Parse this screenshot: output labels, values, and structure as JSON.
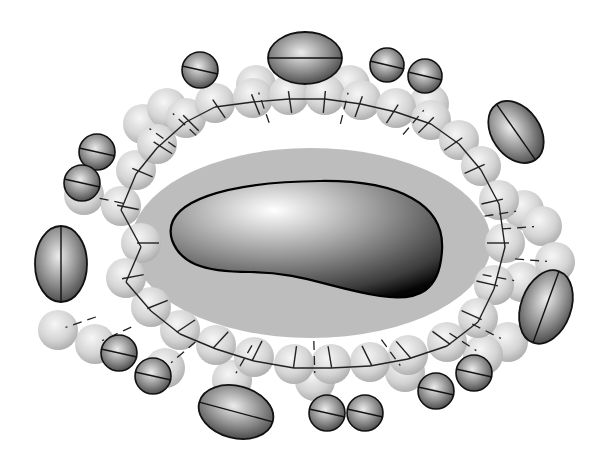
{
  "figure": {
    "colors": {
      "background": "#ffffff",
      "halo": "#bdbdbd",
      "light_sphere_highlight": "#f4f4f4",
      "light_sphere_shade": "#b0b0b0",
      "dark_sphere_highlight": "#e6e6e6",
      "dark_sphere_shade": "#3a3a3a",
      "core_highlight": "#ffffff",
      "core_shade": "#000000",
      "outline": "#111111"
    },
    "core": {
      "path": "M172,240 C160,200 230,182 320,181 C400,180 445,205 442,250 C440,290 420,302 380,296 C330,288 300,272 250,272 C200,272 180,262 172,240 Z"
    },
    "halo": {
      "cx": 311,
      "cy": 243,
      "rx": 180,
      "ry": 95
    },
    "inner_ring": [
      [
        141,
        243
      ],
      [
        121,
        206
      ],
      [
        136,
        170
      ],
      [
        157,
        144
      ],
      [
        186,
        118
      ],
      [
        215,
        103
      ],
      [
        253,
        98
      ],
      [
        289,
        95
      ],
      [
        325,
        95
      ],
      [
        361,
        100
      ],
      [
        396,
        108
      ],
      [
        431,
        120
      ],
      [
        459,
        140
      ],
      [
        481,
        166
      ],
      [
        499,
        200
      ],
      [
        505,
        243
      ],
      [
        494,
        285
      ],
      [
        478,
        318
      ],
      [
        447,
        342
      ],
      [
        408,
        355
      ],
      [
        370,
        362
      ],
      [
        331,
        364
      ],
      [
        294,
        364
      ],
      [
        254,
        357
      ],
      [
        216,
        345
      ],
      [
        180,
        330
      ],
      [
        151,
        307
      ],
      [
        126,
        278
      ]
    ],
    "outer_ring": [
      [
        84,
        195
      ],
      [
        143,
        124
      ],
      [
        167,
        108
      ],
      [
        256,
        85
      ],
      [
        350,
        85
      ],
      [
        429,
        104
      ],
      [
        524,
        210
      ],
      [
        542,
        226
      ],
      [
        555,
        262
      ],
      [
        522,
        282
      ],
      [
        508,
        342
      ],
      [
        483,
        355
      ],
      [
        405,
        372
      ],
      [
        315,
        381
      ],
      [
        232,
        380
      ],
      [
        165,
        368
      ],
      [
        95,
        344
      ],
      [
        58,
        330
      ]
    ],
    "dark_spheres": [
      {
        "cx": 97,
        "cy": 152,
        "r": 18
      },
      {
        "cx": 82,
        "cy": 183,
        "r": 18
      },
      {
        "cx": 200,
        "cy": 70,
        "r": 18
      },
      {
        "cx": 387,
        "cy": 65,
        "r": 17
      },
      {
        "cx": 425,
        "cy": 76,
        "r": 17
      },
      {
        "cx": 119,
        "cy": 353,
        "r": 18
      },
      {
        "cx": 153,
        "cy": 376,
        "r": 18
      },
      {
        "cx": 327,
        "cy": 413,
        "r": 18
      },
      {
        "cx": 365,
        "cy": 413,
        "r": 18
      },
      {
        "cx": 436,
        "cy": 391,
        "r": 18
      },
      {
        "cx": 474,
        "cy": 373,
        "r": 18
      }
    ],
    "ellipsoids": [
      {
        "cx": 305,
        "cy": 58,
        "rx": 37,
        "ry": 26,
        "rot": 0
      },
      {
        "cx": 516,
        "cy": 132,
        "rx": 24,
        "ry": 34,
        "rot": -35
      },
      {
        "cx": 61,
        "cy": 264,
        "rx": 26,
        "ry": 38,
        "rot": 0
      },
      {
        "cx": 546,
        "cy": 307,
        "rx": 25,
        "ry": 38,
        "rot": 20
      },
      {
        "cx": 236,
        "cy": 412,
        "rx": 38,
        "ry": 26,
        "rot": 15
      }
    ]
  }
}
